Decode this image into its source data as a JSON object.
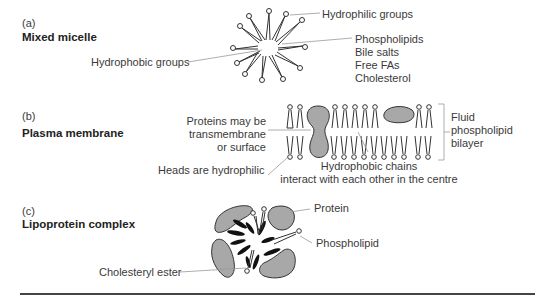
{
  "panels": [
    {
      "letter": "(a)",
      "title": "Mixed micelle",
      "labels": {
        "hydrophilic": "Hydrophilic groups",
        "hydrophobic": "Hydrophobic groups",
        "components": [
          "Phospholipids",
          "Bile salts",
          "Free FAs",
          "Cholesterol"
        ]
      }
    },
    {
      "letter": "(b)",
      "title": "Plasma membrane",
      "labels": {
        "proteins": [
          "Proteins may be",
          "transmembrane",
          "or surface"
        ],
        "heads": "Heads are hydrophilic",
        "chains": [
          "Hydrophobic chains",
          "interact with each other in the centre"
        ],
        "bilayer": [
          "Fluid",
          "phospholipid",
          "bilayer"
        ]
      }
    },
    {
      "letter": "(c)",
      "title": "Lipoprotein complex",
      "labels": {
        "protein": "Protein",
        "phospholipid": "Phospholipid",
        "cholesteryl_ester": "Cholesteryl ester"
      }
    }
  ],
  "colors": {
    "protein_fill": "#a8a8a8",
    "line": "#333333",
    "leader": "#999999",
    "rule": "#444444"
  }
}
